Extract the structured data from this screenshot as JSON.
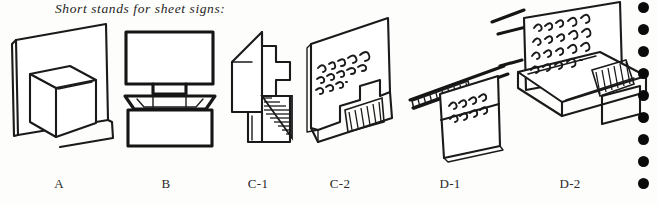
{
  "caption": "Short stands for sheet signs:",
  "figures": [
    {
      "id": "A",
      "label": "A",
      "label_x": 59,
      "name": "figure-a-sheet-panel-with-open-box",
      "description": "Flat sheet sign panel standing upright behind an open rectangular box base",
      "handwriting": ""
    },
    {
      "id": "B",
      "label": "B",
      "label_x": 166,
      "name": "figure-b-panel-with-tab-in-box",
      "description": "Rectangular sign panel with a narrow tab slotted into an open box base",
      "handwriting": ""
    },
    {
      "id": "C-1",
      "label": "C-1",
      "label_x": 258,
      "name": "figure-c1-folded-angular-stand",
      "description": "Angular folded card stand shown in three-quarter view with hatched shading on the inner fold",
      "handwriting": ""
    },
    {
      "id": "C-2",
      "label": "C-2",
      "label_x": 340,
      "name": "figure-c2-folded-stand-with-lettered-sign",
      "description": "Folded stand holding a lettered sheet sign, hatched shading along the folded base",
      "handwriting": "I am the way, the truth and the life."
    },
    {
      "id": "D-1",
      "label": "D-1",
      "label_x": 450,
      "name": "figure-d1-back-of-stand",
      "description": "Rear view of a long trough stand with a sign card leaning back, hatched strip along the rail",
      "handwriting": "back of stand"
    },
    {
      "id": "D-2",
      "label": "D-2",
      "label_x": 570,
      "name": "figure-d2-trough-stand-with-lettered-sign",
      "description": "Long channel trough stand holding an upright lettered sheet sign, hatched end block",
      "handwriting": "I am the way, the truth and the life."
    }
  ],
  "binding_dots": {
    "name": "binding-hole-dots",
    "count": 9,
    "color": "#0a0a0a",
    "diameter": 11,
    "spacing": 22,
    "first_top": 2
  },
  "colors": {
    "background": "#fdfdfc",
    "ink": "#1a1a1a",
    "label_text": "#2a2a2a"
  }
}
